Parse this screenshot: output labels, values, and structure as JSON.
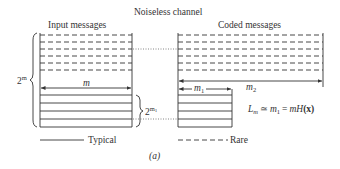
{
  "diagram": {
    "title": "Noiseless channel",
    "left_panel": {
      "heading": "Input messages",
      "width_label": "m",
      "total_count_label_base": "2",
      "total_count_label_exp": "m",
      "typical_count_label_base": "2",
      "typical_count_label_exp": "m",
      "typical_count_label_sub": "1",
      "rare_rows": 6,
      "typical_rows": 4
    },
    "right_panel": {
      "heading": "Coded messages",
      "rare_width_label": "m",
      "rare_width_label_sub": "2",
      "typical_width_label": "m",
      "typical_width_label_sub": "1",
      "rare_rows": 6,
      "typical_rows": 4
    },
    "equation": {
      "lhs": "L",
      "lhs_sub": "m",
      "approx": "≃",
      "m1": "m",
      "m1_sub": "1",
      "equals": "=",
      "rhs": "mH",
      "rhs_arg": "(x)"
    },
    "legend": {
      "typical_label": "Typical",
      "rare_label": "Rare"
    },
    "caption": "(a)",
    "colors": {
      "line": "#333333",
      "dotted": "#666666",
      "background": "#ffffff"
    }
  }
}
